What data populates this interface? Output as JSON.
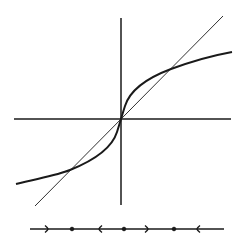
{
  "diagram": {
    "type": "phase-portrait-cobweb",
    "colors": {
      "stroke": "#1a1a1a",
      "background": "#ffffff"
    },
    "axes": {
      "horizontal": {
        "x1": 14,
        "y1": 119,
        "x2": 231,
        "y2": 119
      },
      "vertical": {
        "x1": 121,
        "y1": 18,
        "x2": 121,
        "y2": 205
      }
    },
    "identity_line": {
      "x1": 35,
      "y1": 206,
      "x2": 223,
      "y2": 16
    },
    "curve": {
      "path": "M16,184 C40,178 58,175 70,170 C95,160 112,148 117,132 C119,126 120,122 121,119 C122,116 123,112 125,106 C130,90 147,78 171,69 C190,62 210,56 232,52"
    },
    "fixed_points_on_graph": [
      {
        "x": 70,
        "y": 170
      },
      {
        "x": 121,
        "y": 119
      },
      {
        "x": 171,
        "y": 69
      }
    ],
    "phase_line": {
      "y": 229,
      "x1": 30,
      "x2": 224,
      "dots": [
        {
          "x": 72,
          "label": "fixed-point-left"
        },
        {
          "x": 124,
          "label": "fixed-point-origin"
        },
        {
          "x": 174,
          "label": "fixed-point-right"
        }
      ],
      "arrows": [
        {
          "x": 48,
          "direction": "right"
        },
        {
          "x": 99,
          "direction": "left"
        },
        {
          "x": 148,
          "direction": "right"
        },
        {
          "x": 197,
          "direction": "left"
        }
      ]
    }
  }
}
